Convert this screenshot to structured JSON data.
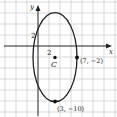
{
  "diagram": {
    "type": "ellipse-on-coordinate-plane",
    "axes": {
      "x_label": "x",
      "y_label": "y"
    },
    "grid": {
      "on": true,
      "spacing_units": 2,
      "color": "#c8c8c8"
    },
    "tick_labels": {
      "x": "2",
      "y": "2"
    },
    "ellipse": {
      "center": [
        3,
        -2
      ],
      "semi_axis_x": 4,
      "semi_axis_y": 8,
      "stroke": "#222222"
    },
    "points": [
      {
        "name": "C",
        "coords": [
          3,
          -2
        ],
        "label": "C"
      },
      {
        "name": "right-vertex",
        "coords": [
          7,
          -2
        ],
        "label": "(7, −2)"
      },
      {
        "name": "bottom-vertex",
        "coords": [
          3,
          -10
        ],
        "label": "(3, −10)"
      }
    ]
  }
}
